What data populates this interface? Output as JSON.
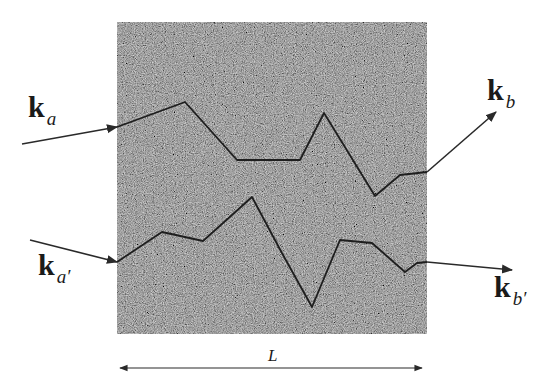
{
  "diagram": {
    "medium": {
      "fill": "#5a5a5a",
      "texture": "random-noise",
      "x": 117,
      "y": 22,
      "width": 310,
      "height": 312
    },
    "labels": {
      "ka": {
        "base": "k",
        "sub": "a"
      },
      "kb": {
        "base": "k",
        "sub": "b"
      },
      "ka_prime": {
        "base": "k",
        "sub": "a′"
      },
      "kb_prime": {
        "base": "k",
        "sub": "b′"
      },
      "length": "L"
    },
    "arrows": {
      "incoming_a": {
        "from": [
          22,
          144
        ],
        "to": [
          117,
          127
        ]
      },
      "outgoing_b": {
        "from": [
          427,
          172
        ],
        "to": [
          496,
          112
        ]
      },
      "incoming_a_prime": {
        "from": [
          30,
          240
        ],
        "to": [
          117,
          262
        ]
      },
      "outgoing_b_prime": {
        "from": [
          427,
          262
        ],
        "to": [
          512,
          270
        ]
      },
      "length_span": {
        "from": [
          120,
          368
        ],
        "to": [
          422,
          368
        ]
      }
    },
    "paths": {
      "upper": [
        [
          117,
          127
        ],
        [
          185,
          102
        ],
        [
          237,
          160
        ],
        [
          300,
          160
        ],
        [
          324,
          113
        ],
        [
          375,
          196
        ],
        [
          400,
          175
        ],
        [
          427,
          172
        ]
      ],
      "lower": [
        [
          117,
          262
        ],
        [
          162,
          232
        ],
        [
          185,
          237
        ],
        [
          203,
          241
        ],
        [
          252,
          197
        ],
        [
          283,
          255
        ],
        [
          312,
          307
        ],
        [
          340,
          240
        ],
        [
          372,
          243
        ],
        [
          405,
          272
        ],
        [
          417,
          263
        ],
        [
          427,
          262
        ]
      ]
    },
    "colors": {
      "line": "#2a2a2a",
      "path": "#1e1e1e",
      "text": "#1a1a1a"
    }
  }
}
